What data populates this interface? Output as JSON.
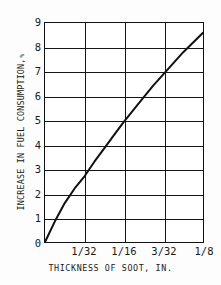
{
  "chart_data": {
    "type": "line",
    "title": "",
    "subtitle": "",
    "xlabel": "THICKNESS OF SOOT, IN.",
    "ylabel": "INCREASE IN FUEL CONSUMPTION,",
    "ylabel_unit": "%",
    "xlim": [
      0,
      0.125
    ],
    "ylim": [
      0,
      9
    ],
    "grid": true,
    "legend": "none",
    "x_tick_labels": [
      "1/32",
      "1/16",
      "3/32",
      "1/8"
    ],
    "x_tick_values": [
      0.03125,
      0.0625,
      0.09375,
      0.125
    ],
    "y_tick_labels": [
      "0",
      "1",
      "2",
      "3",
      "4",
      "5",
      "6",
      "7",
      "8",
      "9"
    ],
    "y_tick_values": [
      0,
      1,
      2,
      3,
      4,
      5,
      6,
      7,
      8,
      9
    ],
    "series": [
      {
        "name": "Increase in fuel consumption",
        "x": [
          0,
          0.0078125,
          0.015625,
          0.0234375,
          0.03125,
          0.0390625,
          0.046875,
          0.0546875,
          0.0625,
          0.0703125,
          0.078125,
          0.0859375,
          0.09375,
          0.1015625,
          0.109375,
          0.1171875,
          0.125
        ],
        "values": [
          0,
          0.85,
          1.6,
          2.2,
          2.7,
          3.3,
          3.85,
          4.4,
          4.95,
          5.45,
          5.95,
          6.45,
          6.9,
          7.35,
          7.8,
          8.2,
          8.6
        ],
        "color": "#111111"
      }
    ],
    "annotations": []
  },
  "axes": {
    "y_title_main": "INCREASE IN FUEL CONSUMPTION,",
    "y_title_unit": "%",
    "x_title": "THICKNESS OF SOOT, IN."
  }
}
